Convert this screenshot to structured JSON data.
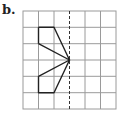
{
  "label": "b.",
  "grid": {
    "cols": 6,
    "rows": 6,
    "line_color": "#999999"
  },
  "axis_of_symmetry": {
    "type": "dashed",
    "column": 3
  },
  "shape": {
    "description": "half-figure polygon left of dashed line of symmetry",
    "points_grid": [
      [
        1,
        1
      ],
      [
        2,
        1
      ],
      [
        3,
        2
      ],
      [
        1,
        2
      ],
      [
        3,
        2
      ],
      [
        1,
        4
      ],
      [
        1,
        5
      ],
      [
        2,
        5
      ],
      [
        3,
        2
      ]
    ],
    "stroke": "#222222"
  }
}
